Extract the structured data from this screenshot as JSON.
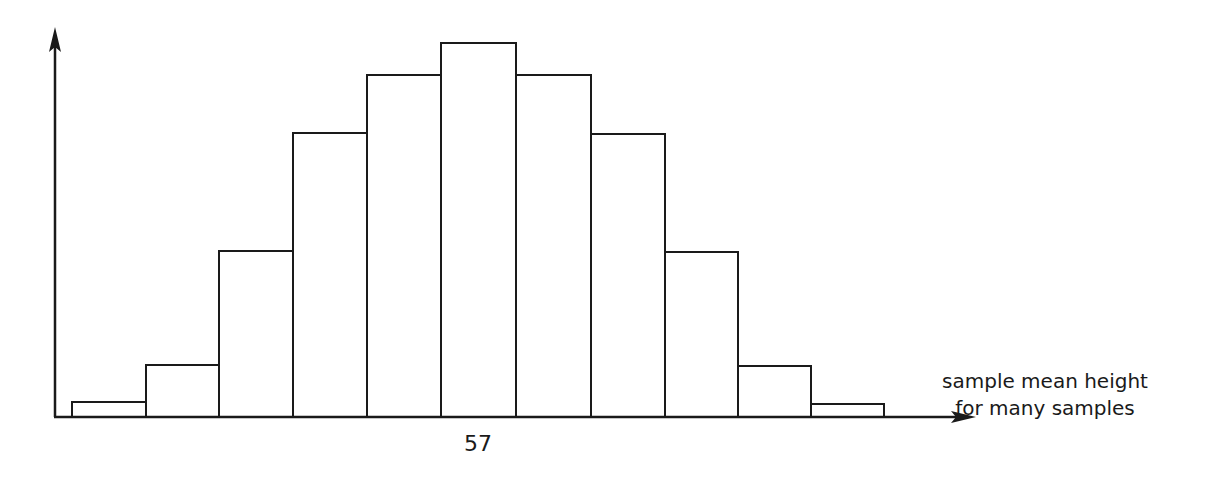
{
  "chart_data": {
    "type": "bar",
    "title": "",
    "xlabel": "sample mean height for many samples",
    "ylabel": "",
    "xticks": [
      {
        "label": "57",
        "position": "center"
      }
    ],
    "categories": [
      "b1",
      "b2",
      "b3",
      "b4",
      "b5",
      "b6",
      "b7",
      "b8",
      "b9",
      "b10",
      "b11"
    ],
    "values": [
      15,
      52,
      166,
      284,
      342,
      374,
      342,
      283,
      165,
      51,
      13
    ],
    "ylim": [
      0,
      390
    ],
    "grid": false,
    "legend": null
  },
  "axis": {
    "x_label_line1": "sample mean height",
    "x_label_line2": "for many samples",
    "center_tick_label": "57"
  },
  "colors": {
    "stroke": "#1a1a1a",
    "fill": "#ffffff",
    "background": "#ffffff"
  }
}
